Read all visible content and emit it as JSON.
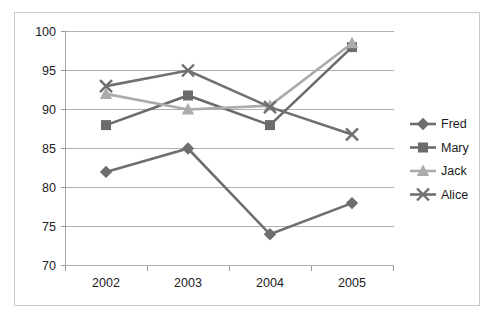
{
  "chart_data": {
    "type": "line",
    "title": "",
    "xlabel": "",
    "ylabel": "",
    "categories": [
      "2002",
      "2003",
      "2004",
      "2005"
    ],
    "ylim": [
      70,
      100
    ],
    "yticks": [
      70,
      75,
      80,
      85,
      90,
      95,
      100
    ],
    "grid": true,
    "legend_position": "right",
    "series": [
      {
        "name": "Fred",
        "marker": "diamond",
        "color": "#6e6e6e",
        "values": [
          82,
          85,
          74,
          78
        ]
      },
      {
        "name": "Mary",
        "marker": "square",
        "color": "#6b6b6b",
        "values": [
          88,
          91.8,
          88,
          98
        ]
      },
      {
        "name": "Jack",
        "marker": "triangle",
        "color": "#ababab",
        "values": [
          92,
          90,
          90.5,
          98.5
        ]
      },
      {
        "name": "Alice",
        "marker": "x",
        "color": "#707070",
        "values": [
          93,
          95,
          90.3,
          86.8
        ]
      }
    ]
  },
  "axis": {
    "y_tick_labels": [
      "100",
      "95",
      "90",
      "85",
      "80",
      "75",
      "70"
    ],
    "x_tick_labels": [
      "2002",
      "2003",
      "2004",
      "2005"
    ]
  },
  "legend": {
    "items": [
      {
        "label": "Fred"
      },
      {
        "label": "Mary"
      },
      {
        "label": "Jack"
      },
      {
        "label": "Alice"
      }
    ]
  },
  "colors": {
    "frame_border": "#c9c9c9",
    "gridline": "#b0b0b0",
    "axis": "#a5a5a5",
    "text": "#1a1a1a",
    "background": "#ffffff"
  }
}
